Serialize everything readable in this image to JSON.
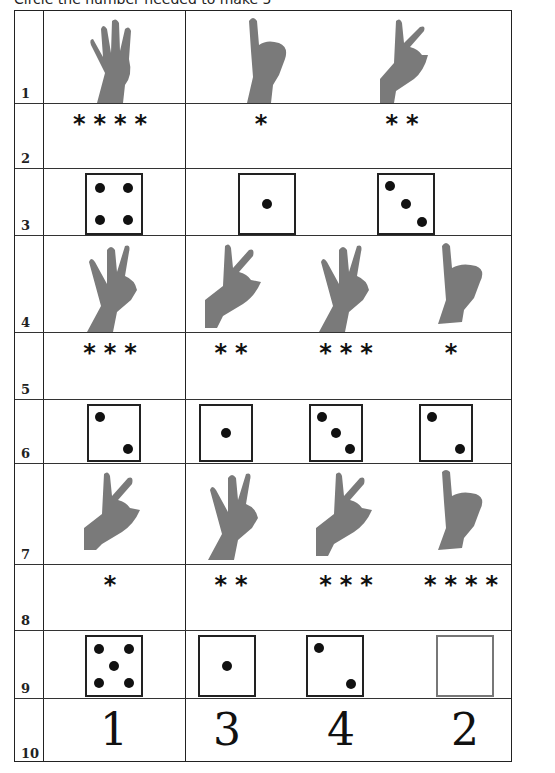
{
  "header": {
    "text": "Circle the number needed to make 5"
  },
  "colors": {
    "line": "#222222",
    "ink": "#111111",
    "skin": "#7a7a7a"
  },
  "rows": [
    {
      "num": "1",
      "type": "hands",
      "left": {
        "fingers": 4
      },
      "right": [
        {
          "fingers": 1
        },
        {
          "fingers": 2
        }
      ]
    },
    {
      "num": "2",
      "type": "stars",
      "left": {
        "count": 4,
        "text": "****"
      },
      "right": [
        {
          "count": 1,
          "text": "*"
        },
        {
          "count": 2,
          "text": "**"
        }
      ]
    },
    {
      "num": "3",
      "type": "dice",
      "left": {
        "pips": 4
      },
      "right": [
        {
          "pips": 1
        },
        {
          "pips": 3
        }
      ]
    },
    {
      "num": "4",
      "type": "hands",
      "left": {
        "fingers": 3
      },
      "right": [
        {
          "fingers": 2
        },
        {
          "fingers": 3
        },
        {
          "fingers": 1
        }
      ]
    },
    {
      "num": "5",
      "type": "stars",
      "left": {
        "count": 3,
        "text": "***"
      },
      "right": [
        {
          "count": 2,
          "text": "**"
        },
        {
          "count": 3,
          "text": "***"
        },
        {
          "count": 1,
          "text": "*"
        }
      ]
    },
    {
      "num": "6",
      "type": "dice",
      "left": {
        "pips": 2
      },
      "right": [
        {
          "pips": 1
        },
        {
          "pips": 3
        },
        {
          "pips": 2
        }
      ]
    },
    {
      "num": "7",
      "type": "hands",
      "left": {
        "fingers": 2
      },
      "right": [
        {
          "fingers": 3
        },
        {
          "fingers": 2
        },
        {
          "fingers": 1
        }
      ]
    },
    {
      "num": "8",
      "type": "stars",
      "left": {
        "count": 1,
        "text": "*"
      },
      "right": [
        {
          "count": 2,
          "text": "**"
        },
        {
          "count": 3,
          "text": "***"
        },
        {
          "count": 4,
          "text": "****"
        }
      ]
    },
    {
      "num": "9",
      "type": "dice",
      "left": {
        "pips": 5
      },
      "right": [
        {
          "pips": 1
        },
        {
          "pips": 2
        },
        {
          "pips": 0
        }
      ]
    },
    {
      "num": "10",
      "type": "numbers",
      "left": {
        "value": "1"
      },
      "right": [
        {
          "value": "3"
        },
        {
          "value": "4"
        },
        {
          "value": "2"
        }
      ]
    }
  ]
}
